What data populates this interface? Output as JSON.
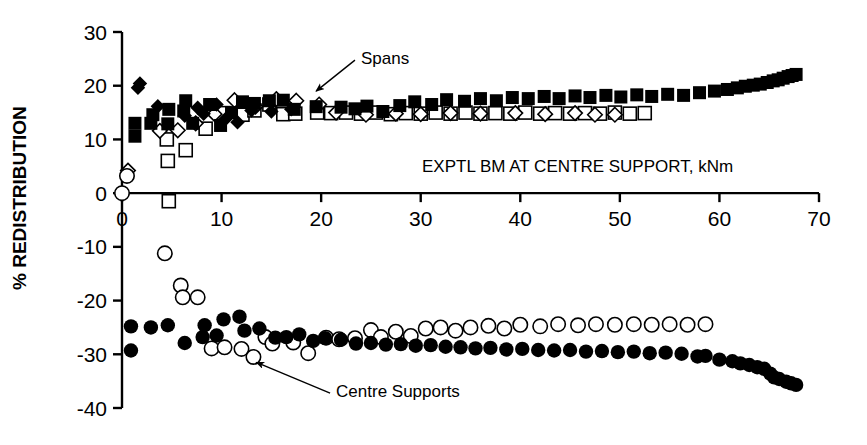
{
  "chart_data": {
    "type": "scatter",
    "title": "",
    "xlabel": "EXPTL BM AT CENTRE SUPPORT, kNm",
    "ylabel": "% REDISTRIBUTION",
    "xlim": [
      0,
      70
    ],
    "ylim": [
      -40,
      30
    ],
    "xticks": [
      0,
      10,
      20,
      30,
      40,
      50,
      60,
      70
    ],
    "xtick_labels": [
      "0",
      "10",
      "20",
      "30",
      "40",
      "50",
      "60",
      "70"
    ],
    "yticks": [
      30,
      20,
      10,
      0,
      -10,
      -20,
      -30,
      -40
    ],
    "ytick_labels": [
      "30",
      "20",
      "10",
      "0",
      "-10",
      "-20",
      "-30",
      "-40"
    ],
    "grid": false,
    "legend": "none",
    "annotations": [
      {
        "text": "Spans",
        "x": 24.0,
        "y": 25.5,
        "arrow_to_x": 19.5,
        "arrow_to_y": 19.0
      },
      {
        "text": "Centre Supports",
        "x": 21.5,
        "y": -36.5,
        "arrow_to_x": 13.5,
        "arrow_to_y": -31.5
      }
    ],
    "series": [
      {
        "name": "spans-filled-square",
        "marker": "filled-square",
        "color": "#000000",
        "points": [
          [
            1.3,
            10.6
          ],
          [
            1.3,
            13.0
          ],
          [
            2.9,
            13.0
          ],
          [
            3.1,
            14.6
          ],
          [
            4.6,
            12.9
          ],
          [
            4.7,
            15.6
          ],
          [
            6.2,
            15.3
          ],
          [
            6.4,
            17.2
          ],
          [
            7.1,
            13.0
          ],
          [
            8.8,
            16.5
          ],
          [
            9.9,
            12.6
          ],
          [
            11.0,
            15.0
          ],
          [
            12.1,
            17.0
          ],
          [
            13.3,
            16.7
          ],
          [
            14.8,
            17.2
          ],
          [
            16.2,
            17.3
          ],
          [
            17.3,
            15.6
          ],
          [
            19.5,
            16.1
          ],
          [
            22.0,
            16.0
          ],
          [
            23.4,
            15.7
          ],
          [
            24.6,
            16.2
          ],
          [
            26.2,
            15.2
          ],
          [
            27.9,
            16.3
          ],
          [
            29.4,
            17.0
          ],
          [
            31.1,
            16.5
          ],
          [
            32.6,
            17.4
          ],
          [
            34.4,
            17.1
          ],
          [
            36.0,
            17.6
          ],
          [
            37.6,
            17.2
          ],
          [
            39.2,
            17.8
          ],
          [
            40.8,
            17.6
          ],
          [
            42.4,
            18.0
          ],
          [
            43.9,
            17.6
          ],
          [
            45.5,
            18.1
          ],
          [
            47.0,
            17.8
          ],
          [
            48.6,
            18.2
          ],
          [
            50.1,
            17.9
          ],
          [
            51.7,
            18.3
          ],
          [
            53.2,
            18.0
          ],
          [
            54.8,
            18.4
          ],
          [
            56.4,
            18.2
          ],
          [
            58.0,
            18.7
          ],
          [
            59.5,
            19.0
          ],
          [
            60.8,
            19.3
          ],
          [
            61.8,
            19.6
          ],
          [
            62.6,
            19.9
          ],
          [
            63.4,
            20.1
          ],
          [
            64.1,
            20.3
          ],
          [
            64.8,
            20.6
          ],
          [
            65.4,
            20.9
          ],
          [
            65.9,
            21.1
          ],
          [
            66.4,
            21.4
          ],
          [
            66.9,
            21.7
          ],
          [
            67.3,
            21.9
          ],
          [
            67.7,
            22.1
          ]
        ]
      },
      {
        "name": "spans-filled-diamond",
        "marker": "filled-diamond",
        "color": "#000000",
        "points": [
          [
            1.6,
            19.6
          ],
          [
            1.8,
            20.4
          ],
          [
            3.6,
            16.2
          ],
          [
            6.3,
            14.4
          ],
          [
            7.6,
            15.9
          ],
          [
            8.2,
            14.8
          ],
          [
            9.5,
            16.5
          ],
          [
            10.4,
            13.8
          ],
          [
            11.6,
            13.2
          ],
          [
            13.0,
            15.4
          ],
          [
            15.0,
            15.2
          ],
          [
            17.0,
            15.6
          ]
        ]
      },
      {
        "name": "spans-open-square",
        "marker": "open-square",
        "color": "#000000",
        "points": [
          [
            4.5,
            10.0
          ],
          [
            4.6,
            6.0
          ],
          [
            4.7,
            -1.5
          ],
          [
            6.4,
            8.0
          ],
          [
            8.4,
            12.0
          ],
          [
            10.2,
            14.9
          ],
          [
            12.1,
            14.6
          ],
          [
            13.3,
            15.4
          ],
          [
            14.8,
            16.5
          ],
          [
            16.2,
            14.7
          ],
          [
            17.4,
            14.8
          ],
          [
            19.6,
            15.0
          ],
          [
            21.0,
            14.9
          ],
          [
            22.5,
            15.0
          ],
          [
            24.0,
            14.8
          ],
          [
            25.5,
            15.0
          ],
          [
            27.0,
            14.7
          ],
          [
            28.5,
            14.9
          ],
          [
            30.0,
            14.8
          ],
          [
            31.5,
            15.0
          ],
          [
            33.0,
            14.8
          ],
          [
            34.5,
            15.0
          ],
          [
            36.0,
            14.8
          ],
          [
            37.5,
            14.9
          ],
          [
            39.0,
            14.8
          ],
          [
            40.5,
            15.0
          ],
          [
            42.0,
            14.8
          ],
          [
            43.5,
            14.9
          ],
          [
            45.0,
            14.8
          ],
          [
            46.5,
            14.9
          ],
          [
            48.0,
            14.8
          ],
          [
            49.5,
            15.0
          ],
          [
            51.0,
            14.8
          ],
          [
            52.5,
            14.9
          ]
        ]
      },
      {
        "name": "spans-open-diamond",
        "marker": "open-diamond",
        "color": "#000000",
        "points": [
          [
            0.0,
            0.0
          ],
          [
            0.6,
            4.2
          ],
          [
            3.8,
            11.6
          ],
          [
            5.6,
            11.7
          ],
          [
            7.4,
            13.0
          ],
          [
            9.3,
            14.7
          ],
          [
            11.3,
            17.3
          ],
          [
            13.4,
            16.1
          ],
          [
            15.5,
            17.5
          ],
          [
            17.5,
            17.2
          ],
          [
            19.8,
            16.5
          ],
          [
            21.5,
            15.0
          ],
          [
            24.5,
            14.6
          ],
          [
            27.5,
            14.8
          ],
          [
            30.0,
            14.7
          ],
          [
            33.0,
            14.9
          ],
          [
            36.0,
            14.8
          ],
          [
            39.5,
            14.9
          ],
          [
            42.5,
            14.7
          ],
          [
            45.5,
            14.9
          ],
          [
            47.5,
            14.6
          ],
          [
            49.5,
            14.6
          ]
        ]
      },
      {
        "name": "centre-supports-filled-circle",
        "marker": "filled-circle",
        "color": "#000000",
        "points": [
          [
            0.9,
            -24.8
          ],
          [
            0.9,
            -29.3
          ],
          [
            2.9,
            -25.0
          ],
          [
            4.6,
            -24.6
          ],
          [
            6.3,
            -27.9
          ],
          [
            8.1,
            -26.8
          ],
          [
            8.3,
            -24.6
          ],
          [
            9.5,
            -26.5
          ],
          [
            10.2,
            -23.5
          ],
          [
            11.8,
            -23.0
          ],
          [
            12.3,
            -25.6
          ],
          [
            13.8,
            -25.2
          ],
          [
            15.4,
            -26.9
          ],
          [
            16.5,
            -26.8
          ],
          [
            17.8,
            -26.3
          ],
          [
            19.2,
            -27.5
          ],
          [
            20.4,
            -27.0
          ],
          [
            22.0,
            -27.3
          ],
          [
            23.5,
            -28.0
          ],
          [
            25.0,
            -27.9
          ],
          [
            26.5,
            -28.2
          ],
          [
            28.0,
            -28.1
          ],
          [
            29.5,
            -28.4
          ],
          [
            31.0,
            -28.3
          ],
          [
            32.5,
            -28.6
          ],
          [
            34.0,
            -28.7
          ],
          [
            35.5,
            -28.9
          ],
          [
            37.0,
            -28.8
          ],
          [
            38.6,
            -29.1
          ],
          [
            40.2,
            -29.0
          ],
          [
            41.8,
            -29.2
          ],
          [
            43.4,
            -29.3
          ],
          [
            45.0,
            -29.2
          ],
          [
            46.6,
            -29.5
          ],
          [
            48.2,
            -29.4
          ],
          [
            49.8,
            -29.6
          ],
          [
            51.4,
            -29.5
          ],
          [
            53.0,
            -29.8
          ],
          [
            54.6,
            -29.7
          ],
          [
            56.2,
            -29.9
          ],
          [
            57.8,
            -30.4
          ],
          [
            58.6,
            -30.3
          ],
          [
            60.0,
            -31.0
          ],
          [
            61.3,
            -31.3
          ],
          [
            62.1,
            -31.7
          ],
          [
            63.0,
            -32.0
          ],
          [
            63.8,
            -32.4
          ],
          [
            64.5,
            -32.7
          ],
          [
            65.1,
            -33.6
          ],
          [
            65.5,
            -34.3
          ],
          [
            66.0,
            -34.6
          ],
          [
            66.7,
            -35.1
          ],
          [
            67.2,
            -35.4
          ],
          [
            67.7,
            -35.7
          ]
        ]
      },
      {
        "name": "centre-supports-open-circle",
        "marker": "open-circle",
        "color": "#000000",
        "points": [
          [
            0.0,
            0.0
          ],
          [
            0.5,
            3.2
          ],
          [
            4.3,
            -11.2
          ],
          [
            5.9,
            -17.2
          ],
          [
            6.1,
            -19.4
          ],
          [
            7.6,
            -19.4
          ],
          [
            9.0,
            -28.9
          ],
          [
            10.3,
            -28.7
          ],
          [
            12.0,
            -29.0
          ],
          [
            13.2,
            -30.5
          ],
          [
            14.4,
            -26.8
          ],
          [
            15.1,
            -28.0
          ],
          [
            17.2,
            -27.8
          ],
          [
            18.7,
            -29.8
          ],
          [
            20.5,
            -26.9
          ],
          [
            21.8,
            -27.2
          ],
          [
            23.4,
            -27.0
          ],
          [
            25.0,
            -25.5
          ],
          [
            26.0,
            -26.8
          ],
          [
            27.5,
            -25.8
          ],
          [
            29.0,
            -26.6
          ],
          [
            30.5,
            -25.2
          ],
          [
            32.0,
            -25.0
          ],
          [
            33.5,
            -25.6
          ],
          [
            35.0,
            -25.0
          ],
          [
            36.8,
            -24.7
          ],
          [
            38.4,
            -25.2
          ],
          [
            40.0,
            -24.5
          ],
          [
            42.0,
            -24.8
          ],
          [
            43.8,
            -24.4
          ],
          [
            45.8,
            -24.6
          ],
          [
            47.6,
            -24.4
          ],
          [
            49.5,
            -24.5
          ],
          [
            51.4,
            -24.4
          ],
          [
            53.2,
            -24.5
          ],
          [
            55.0,
            -24.4
          ],
          [
            56.8,
            -24.5
          ],
          [
            58.6,
            -24.4
          ]
        ]
      }
    ]
  },
  "axis": {
    "x_title": "EXPTL BM AT CENTRE SUPPORT, kNm",
    "y_title": "% REDISTRIBUTION"
  },
  "annotation_labels": {
    "spans": "Spans",
    "centre_supports": "Centre Supports"
  }
}
